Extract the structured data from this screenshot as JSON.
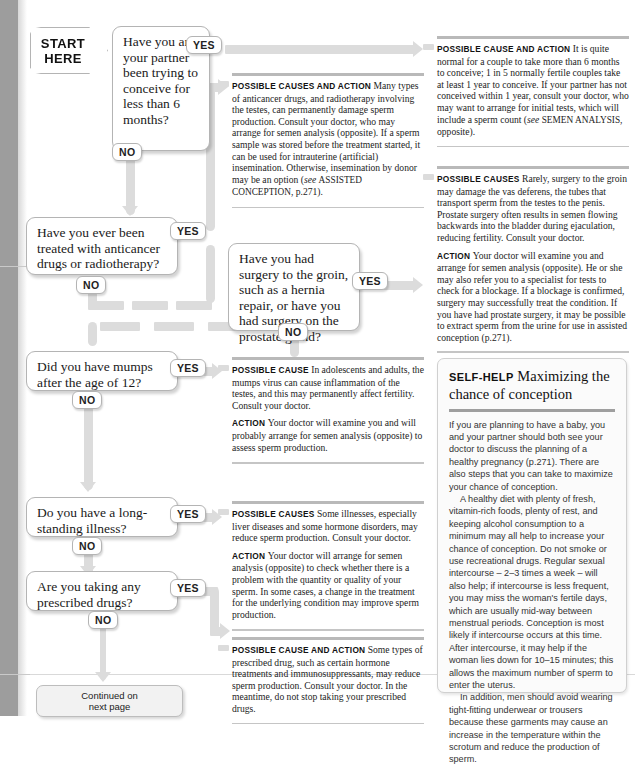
{
  "flowchart": {
    "start": {
      "line1": "START",
      "line2": "HERE"
    },
    "continued": {
      "line1": "Continued on",
      "line2": "next page"
    },
    "yes_label": "YES",
    "no_label": "NO",
    "questions": [
      {
        "id": "q1",
        "text": "Have you and your partner been trying to conceive for less than 6 months?"
      },
      {
        "id": "q2",
        "text": "Have you ever been treated with anticancer drugs or radiotherapy?"
      },
      {
        "id": "q3",
        "text": "Have you had surgery to the groin, such as a hernia repair, or have you had surgery on the prostate gland?"
      },
      {
        "id": "q4",
        "text": "Did you have mumps after the age of 12?"
      },
      {
        "id": "q5",
        "text": "Do you have a long-standing illness?"
      },
      {
        "id": "q6",
        "text": "Are you taking any prescribed drugs?"
      }
    ]
  },
  "panels": [
    {
      "id": "panel-6-months",
      "blocks": [
        {
          "lead": "POSSIBLE CAUSE AND ACTION",
          "body": "It is quite normal for a couple to take more than 6 months to conceive; 1 in 5 normally fertile couples take at least 1 year to conceive. If your partner has not conceived within 1 year, consult your doctor, who may want to arrange for initial tests, which will include a sperm count (",
          "italic": "see",
          "smallcaps": "SEMEN ANALYSIS",
          "tail": ", opposite)."
        }
      ]
    },
    {
      "id": "panel-anticancer",
      "blocks": [
        {
          "lead": "POSSIBLE CAUSES AND ACTION",
          "body": "Many types of anticancer drugs, and radiotherapy involving the testes, can permanently damage sperm production. Consult your doctor, who may arrange for semen analysis (opposite). If a sperm sample was stored before the treatment started, it can be used for intrauterine (artificial) insemination. Otherwise, insemination by donor may be an option (",
          "italic": "see",
          "smallcaps": "ASSISTED CONCEPTION",
          "tail": ", p.271)."
        }
      ]
    },
    {
      "id": "panel-surgery",
      "blocks": [
        {
          "lead": "POSSIBLE CAUSES",
          "body": "Rarely, surgery to the groin may damage the vas deferens, the tubes that transport sperm from the testes to the penis. Prostate surgery often results in semen flowing backwards into the bladder during ejaculation, reducing fertility. Consult your doctor."
        },
        {
          "lead": "ACTION",
          "body": "Your doctor will examine you and arrange for semen analysis (opposite). He or she may also refer you to a specialist for tests to check for a blockage. If a blockage is confirmed, surgery may successfully treat the condition. If you have had prostate surgery, it may be possible to extract sperm from the urine for use in assisted conception (p.271)."
        }
      ]
    },
    {
      "id": "panel-mumps",
      "blocks": [
        {
          "lead": "POSSIBLE CAUSE",
          "body": "In adolescents and adults, the mumps virus can cause inflammation of the testes, and this may permanently affect fertility. Consult your doctor."
        },
        {
          "lead": "ACTION",
          "body": "Your doctor will examine you and will probably arrange for semen analysis (opposite) to assess sperm production."
        }
      ]
    },
    {
      "id": "panel-illness",
      "blocks": [
        {
          "lead": "POSSIBLE CAUSES",
          "body": "Some illnesses, especially liver diseases and some hormone disorders, may reduce sperm production. Consult your doctor."
        },
        {
          "lead": "ACTION",
          "body": "Your doctor will arrange for semen analysis (opposite) to check whether there is a problem with the quantity or quality of your sperm. In some cases, a change in the treatment for the underlying condition may improve sperm production."
        }
      ]
    },
    {
      "id": "panel-drugs",
      "blocks": [
        {
          "lead": "POSSIBLE CAUSE AND ACTION",
          "body": "Some types of prescribed drug, such as certain hormone treatments and immunosuppressants, may reduce sperm production. Consult your doctor. In the meantime, do not stop taking your prescribed drugs."
        }
      ]
    }
  ],
  "selfhelp": {
    "kicker": "SELF-HELP",
    "title": "Maximizing the chance of conception",
    "paragraphs": [
      "If you are planning to have a baby, you and your partner should both see your doctor to discuss the planning of a healthy pregnancy (p.271). There are also steps that you can take to maximize your chance of conception.",
      "A healthy diet with plenty of fresh, vitamin-rich foods, plenty of rest, and keeping alcohol consumption to a minimum may all help to increase your chance of conception. Do not smoke or use recreational drugs. Regular sexual intercourse – 2–3 times a week – will also help; if intercourse is less frequent, you may miss the woman's fertile days, which are usually mid-way between menstrual periods. Conception is most likely if intercourse occurs at this time. After intercourse, it may help if the woman lies down for 10–15 minutes; this allows the maximum number of sperm to enter the uterus.",
      "In addition, men should avoid wearing tight-fitting underwear or trousers because these garments may cause an increase in the temperature within the scrotum and reduce the production of sperm."
    ]
  },
  "colors": {
    "connector": "#dcdcdc",
    "box_border": "#b4b4b4",
    "rule": "#b9b9b9",
    "gutter": "#9d9d9d"
  }
}
